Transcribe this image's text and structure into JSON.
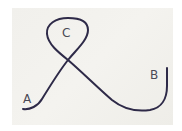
{
  "figure": {
    "labels": {
      "a": "A",
      "b": "B",
      "c": "C"
    },
    "colors": {
      "background": "#f2f1ed",
      "string": "#2e2a48",
      "label": "#4a4a55"
    }
  }
}
